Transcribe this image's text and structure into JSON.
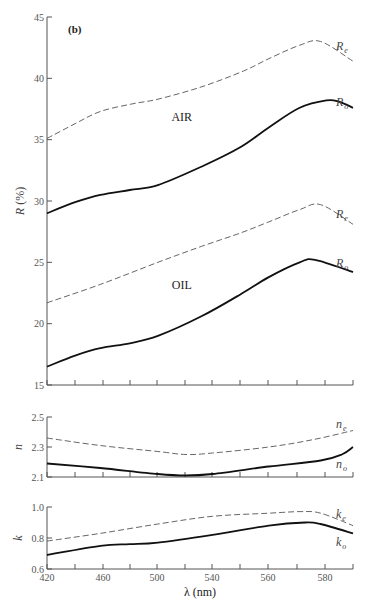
{
  "chart_data": [
    {
      "type": "line",
      "panel_tag": "(b)",
      "ylabel": "R (%)",
      "ylim": [
        15,
        45
      ],
      "yticks": [
        15,
        20,
        25,
        30,
        35,
        40,
        45
      ],
      "xlim": [
        420,
        638
      ],
      "annotations": [
        {
          "text": "AIR",
          "x": 516,
          "y": 36.5
        },
        {
          "text": "OIL",
          "x": 516,
          "y": 22.8
        }
      ],
      "series": [
        {
          "name": "R_e (air)",
          "label": "R",
          "sub": "e",
          "style": "dashed",
          "x": [
            420,
            440,
            458,
            480,
            499,
            530,
            560,
            578,
            600,
            615,
            638
          ],
          "y": [
            35.1,
            36.3,
            37.3,
            37.9,
            38.3,
            39.3,
            40.6,
            41.6,
            42.7,
            43.0,
            41.4
          ]
        },
        {
          "name": "R_o (air)",
          "label": "R",
          "sub": "o",
          "style": "solid",
          "x": [
            420,
            440,
            458,
            479,
            499,
            530,
            558,
            578,
            600,
            619,
            628,
            638
          ],
          "y": [
            29.0,
            29.9,
            30.5,
            30.9,
            31.3,
            32.8,
            34.4,
            36.0,
            37.6,
            38.2,
            38.1,
            37.6
          ]
        },
        {
          "name": "R_e (oil)",
          "label": "R",
          "sub": "e",
          "style": "dashed",
          "x": [
            420,
            458,
            499,
            530,
            558,
            578,
            600,
            615,
            638
          ],
          "y": [
            21.7,
            23.2,
            25.0,
            26.3,
            27.4,
            28.3,
            29.3,
            29.7,
            28.1
          ]
        },
        {
          "name": "R_o (oil)",
          "label": "R",
          "sub": "o",
          "style": "solid",
          "x": [
            420,
            440,
            458,
            479,
            499,
            530,
            558,
            578,
            600,
            611,
            638
          ],
          "y": [
            16.5,
            17.4,
            18.0,
            18.4,
            19.0,
            20.6,
            22.4,
            23.8,
            25.0,
            25.2,
            24.2
          ]
        }
      ]
    },
    {
      "type": "line",
      "ylabel": "n",
      "ylim": [
        2.1,
        2.5
      ],
      "yticks": [
        2.1,
        2.3,
        2.5
      ],
      "xlim": [
        420,
        638
      ],
      "series": [
        {
          "name": "n_e",
          "label": "n",
          "sub": "e",
          "style": "dashed",
          "x": [
            420,
            458,
            499,
            519,
            538,
            578,
            610,
            638
          ],
          "y": [
            2.36,
            2.31,
            2.27,
            2.25,
            2.26,
            2.3,
            2.35,
            2.41
          ]
        },
        {
          "name": "n_o",
          "label": "n",
          "sub": "o",
          "style": "solid",
          "x": [
            420,
            458,
            499,
            519,
            538,
            578,
            615,
            630,
            638
          ],
          "y": [
            2.19,
            2.16,
            2.12,
            2.11,
            2.12,
            2.17,
            2.21,
            2.25,
            2.3
          ]
        }
      ]
    },
    {
      "type": "line",
      "ylabel": "k",
      "xlabel": "λ (nm)",
      "ylim": [
        0.6,
        1.0
      ],
      "yticks": [
        0.6,
        0.8,
        1.0
      ],
      "xlim": [
        420,
        638
      ],
      "xtick_labels": [
        "420",
        "460",
        "500",
        "540",
        "560",
        "580"
      ],
      "series": [
        {
          "name": "k_e",
          "label": "k",
          "sub": "e",
          "style": "dashed",
          "x": [
            420,
            458,
            499,
            538,
            578,
            601,
            615,
            638
          ],
          "y": [
            0.78,
            0.83,
            0.89,
            0.94,
            0.96,
            0.97,
            0.96,
            0.88
          ]
        },
        {
          "name": "k_o",
          "label": "k",
          "sub": "o",
          "style": "solid",
          "x": [
            420,
            458,
            479,
            499,
            538,
            578,
            604,
            615,
            638
          ],
          "y": [
            0.69,
            0.75,
            0.76,
            0.77,
            0.82,
            0.88,
            0.9,
            0.89,
            0.83
          ]
        }
      ]
    }
  ]
}
